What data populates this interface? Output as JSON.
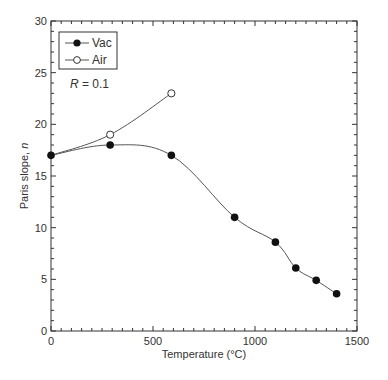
{
  "chart_data": {
    "type": "line",
    "title": "",
    "xlabel": "Temperature (°C)",
    "ylabel": "Paris slope, n",
    "xlim": [
      0,
      1500
    ],
    "ylim": [
      0,
      30
    ],
    "xticks": [
      0,
      500,
      1000,
      1500
    ],
    "yticks": [
      0,
      5,
      10,
      15,
      20,
      25,
      30
    ],
    "x_minor_step": 50,
    "y_minor_step": 1,
    "grid": false,
    "legend_position": "upper-left",
    "annotation": "R = 0.1",
    "series": [
      {
        "name": "Vac",
        "marker": "filled-circle",
        "x": [
          0,
          290,
          590,
          900,
          1100,
          1200,
          1300,
          1400
        ],
        "y": [
          17,
          18,
          17,
          11,
          8.6,
          6.1,
          4.9,
          3.6
        ]
      },
      {
        "name": "Air",
        "marker": "open-circle",
        "x": [
          0,
          290,
          590
        ],
        "y": [
          17,
          19,
          23
        ]
      }
    ]
  },
  "legend": {
    "items": [
      {
        "label": "Vac"
      },
      {
        "label": "Air"
      }
    ]
  },
  "annotation": {
    "prefix": "R",
    "value": " = 0.1"
  },
  "axes": {
    "xlabel": "Temperature (°C)",
    "ylabel_prefix": "Paris slope, ",
    "ylabel_var": "n"
  },
  "colors": {
    "axis": "#333333",
    "line": "#555555",
    "marker": "#111111"
  }
}
